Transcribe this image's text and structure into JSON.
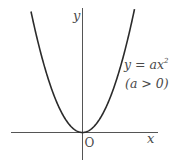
{
  "figure": {
    "type": "function-graph",
    "axes": {
      "x_label": "x",
      "y_label": "y",
      "origin_label": "O"
    },
    "curve": {
      "equation_label": "y = ax",
      "exponent": "2",
      "condition_label": "(a > 0)",
      "vertex": [
        0,
        0
      ],
      "opens": "up"
    },
    "colors": {
      "curve": "#2b2b2b",
      "axes": "#555555",
      "text": "#4a4a4a",
      "background": "#ffffff"
    }
  }
}
